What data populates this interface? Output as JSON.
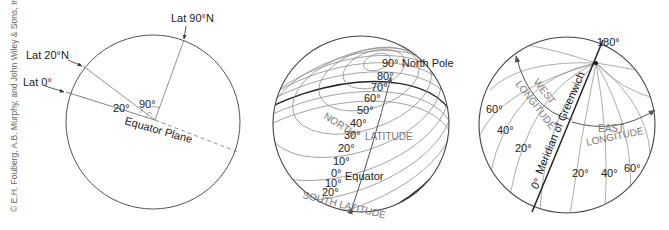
{
  "credit": "© E.H. Fouberg, A.B. Murphy, and John Wiley & Sons, Inc.",
  "diagram1": {
    "labels": {
      "lat90": "Lat 90°N",
      "lat20": "Lat 20°N",
      "lat0": "Lat 0°",
      "angle20": "20°",
      "angle90": "90°",
      "equator_plane": "Equator Plane"
    }
  },
  "diagram2": {
    "north_pole": "90° North Pole",
    "north_latitude": "NORTH",
    "latitude_word": "LATITUDE",
    "south_latitude": "SOUTH LATITUDE",
    "equator": "Equator",
    "north_ticks": [
      "80°",
      "70°",
      "60°",
      "50°",
      "40°",
      "30°",
      "20°",
      "10°",
      "0°"
    ],
    "south_ticks": [
      "10°",
      "20°"
    ]
  },
  "diagram3": {
    "top": "180°",
    "west": "WEST",
    "west_longitude": "LONGITUDE",
    "east": "EAST",
    "east_longitude": "LONGITUDE",
    "meridian": "Meridian of Greenwich",
    "west_ticks": [
      "60°",
      "40°",
      "20°"
    ],
    "zero": "0°",
    "east_ticks": [
      "20°",
      "40°",
      "60°"
    ]
  }
}
